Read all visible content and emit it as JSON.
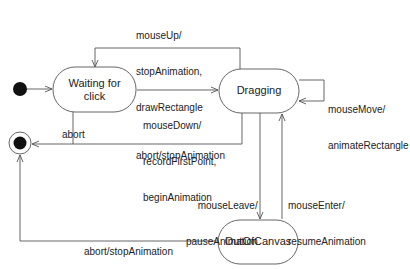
{
  "diagram": {
    "type": "UML state machine",
    "states": [
      {
        "id": "waiting",
        "label_line1": "Waiting for",
        "label_line2": "click"
      },
      {
        "id": "dragging",
        "label": "Dragging"
      },
      {
        "id": "outofcanvas",
        "label": "OutOfCanvas"
      }
    ],
    "pseudostates": {
      "initial": "initial",
      "final": "final"
    },
    "transitions": [
      {
        "from": "initial",
        "to": "waiting",
        "l1": "",
        "l2": "",
        "l3": ""
      },
      {
        "from": "dragging",
        "to": "waiting",
        "l1": "mouseUp/",
        "l2": "stopAnimation,",
        "l3": "drawRectangle"
      },
      {
        "from": "waiting",
        "to": "dragging",
        "l1": "mouseDown/",
        "l2": "recordFirstPoint,",
        "l3": "beginAnimation"
      },
      {
        "from": "dragging",
        "to": "dragging",
        "l1": "mouseMove/",
        "l2": "animateRectangle",
        "l3": ""
      },
      {
        "from": "waiting",
        "to": "final",
        "l1": "abort",
        "l2": "",
        "l3": ""
      },
      {
        "from": "dragging",
        "to": "final",
        "l1": "abort/stopAnimation",
        "l2": "",
        "l3": ""
      },
      {
        "from": "dragging",
        "to": "outofcanvas",
        "l1": "mouseLeave/",
        "l2": "pauseAnimation",
        "l3": ""
      },
      {
        "from": "outofcanvas",
        "to": "dragging",
        "l1": "mouseEnter/",
        "l2": "resumeAnimation",
        "l3": ""
      },
      {
        "from": "outofcanvas",
        "to": "final",
        "l1": "abort/stopAnimation",
        "l2": "",
        "l3": ""
      }
    ]
  }
}
